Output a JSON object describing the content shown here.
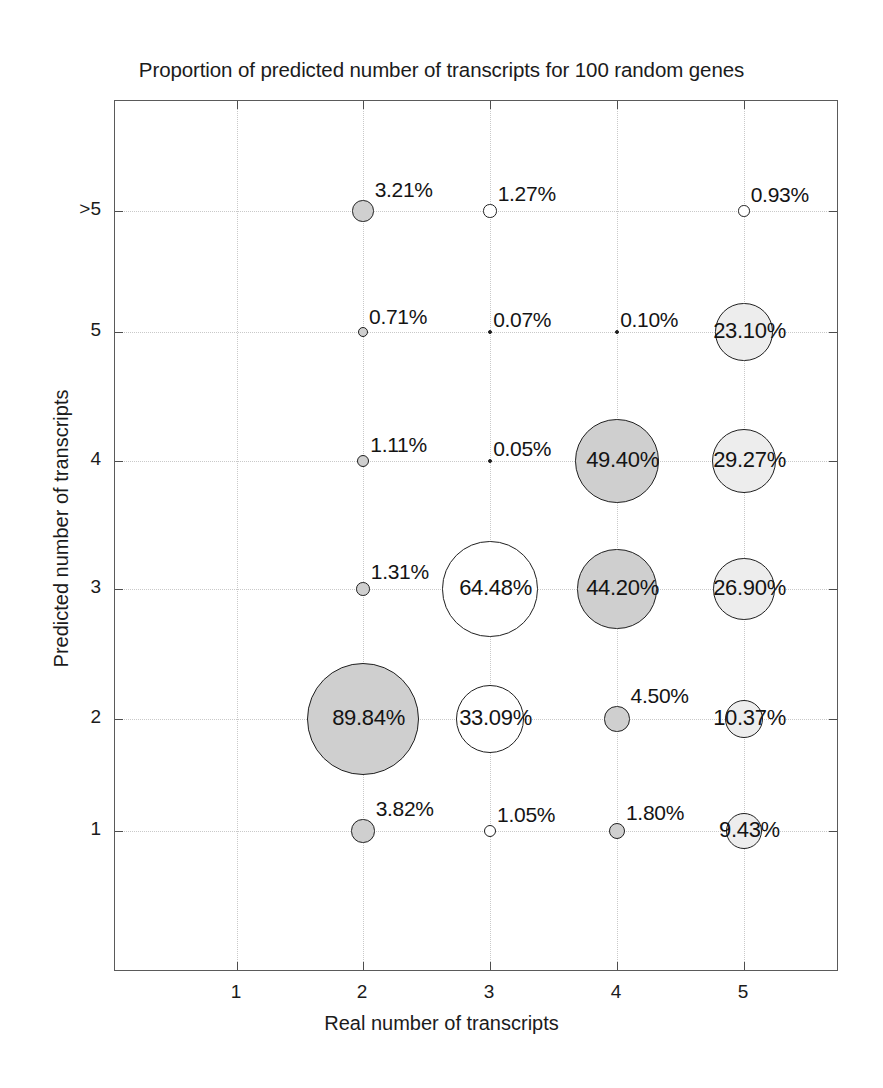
{
  "chart_data": {
    "type": "scatter",
    "subtype": "bubble-matrix",
    "title": "Proportion of predicted number of transcripts for 100 random genes",
    "xlabel": "Real number of transcripts",
    "ylabel": "Predicted number of transcripts",
    "xticks": [
      "1",
      "2",
      "3",
      "4",
      "5"
    ],
    "yticks": [
      "1",
      "2",
      "3",
      "4",
      "5",
      ">5"
    ],
    "xlim": [
      0.5,
      5.5
    ],
    "ylim": [
      0.5,
      6.5
    ],
    "grid": true,
    "legend": "none",
    "unit": "%",
    "colors": {
      "bubble_fill_gray": "#cfcfcf",
      "bubble_fill_light": "#ededed",
      "bubble_fill_white": "#ffffff",
      "bubble_stroke": "#1f1f1f",
      "axis": "#5a5a5a",
      "grid": "#c9c9c9",
      "text": "#1b1b1b"
    },
    "points": [
      {
        "x": 2,
        "y": 6,
        "value": 3.21,
        "label": "3.21%",
        "fill": "gray",
        "label_pos": "outside"
      },
      {
        "x": 3,
        "y": 6,
        "value": 1.27,
        "label": "1.27%",
        "fill": "white",
        "label_pos": "outside"
      },
      {
        "x": 5,
        "y": 6,
        "value": 0.93,
        "label": "0.93%",
        "fill": "white",
        "label_pos": "outside"
      },
      {
        "x": 2,
        "y": 5,
        "value": 0.71,
        "label": "0.71%",
        "fill": "gray",
        "label_pos": "outside"
      },
      {
        "x": 3,
        "y": 5,
        "value": 0.07,
        "label": "0.07%",
        "fill": "dark",
        "label_pos": "outside"
      },
      {
        "x": 4,
        "y": 5,
        "value": 0.1,
        "label": "0.10%",
        "fill": "dark",
        "label_pos": "outside"
      },
      {
        "x": 5,
        "y": 5,
        "value": 23.1,
        "label": "23.10%",
        "fill": "light",
        "label_pos": "inside"
      },
      {
        "x": 2,
        "y": 4,
        "value": 1.11,
        "label": "1.11%",
        "fill": "gray",
        "label_pos": "outside"
      },
      {
        "x": 3,
        "y": 4,
        "value": 0.05,
        "label": "0.05%",
        "fill": "dark",
        "label_pos": "outside"
      },
      {
        "x": 4,
        "y": 4,
        "value": 49.4,
        "label": "49.40%",
        "fill": "gray",
        "label_pos": "inside"
      },
      {
        "x": 5,
        "y": 4,
        "value": 29.27,
        "label": "29.27%",
        "fill": "light",
        "label_pos": "inside"
      },
      {
        "x": 2,
        "y": 3,
        "value": 1.31,
        "label": "1.31%",
        "fill": "gray",
        "label_pos": "outside"
      },
      {
        "x": 3,
        "y": 3,
        "value": 64.48,
        "label": "64.48%",
        "fill": "white",
        "label_pos": "inside"
      },
      {
        "x": 4,
        "y": 3,
        "value": 44.2,
        "label": "44.20%",
        "fill": "gray",
        "label_pos": "inside"
      },
      {
        "x": 5,
        "y": 3,
        "value": 26.9,
        "label": "26.90%",
        "fill": "light",
        "label_pos": "inside"
      },
      {
        "x": 2,
        "y": 2,
        "value": 89.84,
        "label": "89.84%",
        "fill": "gray",
        "label_pos": "inside"
      },
      {
        "x": 3,
        "y": 2,
        "value": 33.09,
        "label": "33.09%",
        "fill": "white",
        "label_pos": "inside"
      },
      {
        "x": 4,
        "y": 2,
        "value": 4.5,
        "label": "4.50%",
        "fill": "gray",
        "label_pos": "outside"
      },
      {
        "x": 5,
        "y": 2,
        "value": 10.37,
        "label": "10.37%",
        "fill": "light",
        "label_pos": "inside"
      },
      {
        "x": 2,
        "y": 1,
        "value": 3.82,
        "label": "3.82%",
        "fill": "gray",
        "label_pos": "outside"
      },
      {
        "x": 3,
        "y": 1,
        "value": 1.05,
        "label": "1.05%",
        "fill": "white",
        "label_pos": "outside"
      },
      {
        "x": 4,
        "y": 1,
        "value": 1.8,
        "label": "1.80%",
        "fill": "gray",
        "label_pos": "outside"
      },
      {
        "x": 5,
        "y": 1,
        "value": 9.43,
        "label": "9.43%",
        "fill": "light",
        "label_pos": "inside"
      }
    ]
  },
  "geometry": {
    "plot_left": 114,
    "plot_top": 100,
    "plot_width": 724,
    "plot_height": 871,
    "x_positions": {
      "1": 236,
      "2": 362,
      "3": 489,
      "4": 616,
      "5": 743
    },
    "y_positions": {
      "1": 830,
      "2": 718,
      "3": 588,
      "4": 460,
      "5": 331,
      "6": 210
    },
    "radius_scale": 5.95
  }
}
